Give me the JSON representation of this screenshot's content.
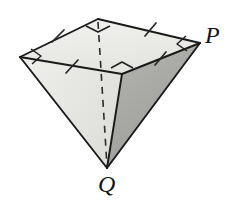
{
  "figure": {
    "name": "inverted-square-pyramid",
    "background_color": "#ffffff",
    "labels": [
      {
        "id": "P",
        "text": "P",
        "x": 205,
        "y": 23,
        "font_size": 24,
        "style": "italic-serif",
        "role": "base-vertex-label"
      },
      {
        "id": "Q",
        "text": "Q",
        "x": 98,
        "y": 172,
        "font_size": 24,
        "style": "italic-serif",
        "role": "apex-vertex-label"
      }
    ],
    "colors": {
      "top_face": "#ededea",
      "left_face": "#e7e7e4",
      "right_face": "#a9a9a6",
      "front_face": "#cfcfcc",
      "stroke": "#1a1a1a",
      "stroke_soft": "#3a3a3a",
      "tick": "#2a2a2a",
      "dashed": "#2b2b2b"
    },
    "vertices": {
      "base_left": {
        "x": 20,
        "y": 57
      },
      "base_back": {
        "x": 98,
        "y": 19
      },
      "base_right_P": {
        "x": 200,
        "y": 43
      },
      "base_front": {
        "x": 122,
        "y": 74
      },
      "apex_Q": {
        "x": 107,
        "y": 168
      }
    },
    "faces": [
      {
        "name": "top-base-square",
        "points": "20,57 98,19 200,43 122,74",
        "fill": "#ededea"
      },
      {
        "name": "left-lateral-face",
        "points": "20,57 122,74 107,168",
        "fill": "#e7e7e4"
      },
      {
        "name": "right-lateral-face",
        "points": "122,74 200,43 107,168",
        "fill": "#a9a9a6"
      }
    ],
    "edges": [
      {
        "name": "base-edge-left-back",
        "x1": 20,
        "y1": 57,
        "x2": 98,
        "y2": 19,
        "style": "solid"
      },
      {
        "name": "base-edge-back-right",
        "x1": 98,
        "y1": 19,
        "x2": 200,
        "y2": 43,
        "style": "solid"
      },
      {
        "name": "base-edge-right-front",
        "x1": 200,
        "y1": 43,
        "x2": 122,
        "y2": 74,
        "style": "solid"
      },
      {
        "name": "base-edge-front-left",
        "x1": 122,
        "y1": 74,
        "x2": 20,
        "y2": 57,
        "style": "solid"
      },
      {
        "name": "lateral-edge-left-apex",
        "x1": 20,
        "y1": 57,
        "x2": 107,
        "y2": 168,
        "style": "solid"
      },
      {
        "name": "lateral-edge-front-apex",
        "x1": 122,
        "y1": 74,
        "x2": 107,
        "y2": 168,
        "style": "solid"
      },
      {
        "name": "lateral-edge-right-apex",
        "x1": 200,
        "y1": 43,
        "x2": 107,
        "y2": 168,
        "style": "solid"
      },
      {
        "name": "lateral-edge-back-apex-hidden",
        "x1": 98,
        "y1": 19,
        "x2": 107,
        "y2": 168,
        "style": "dashed"
      }
    ],
    "tick_marks": [
      {
        "name": "tick-base-edge-left-back",
        "x1": 52,
        "y1": 30,
        "x2": 64,
        "y2": 42
      },
      {
        "name": "tick-base-edge-back-right",
        "x1": 144,
        "y1": 23,
        "x2": 155,
        "y2": 35
      },
      {
        "name": "tick-base-edge-right-front",
        "x1": 156,
        "y1": 53,
        "x2": 166,
        "y2": 64
      },
      {
        "name": "tick-base-edge-front-left",
        "x1": 66,
        "y1": 61,
        "x2": 78,
        "y2": 72
      }
    ],
    "right_angle_marks": [
      {
        "name": "right-angle-mark-back-vertex",
        "points": "86,27 98,19 110,27 98,32"
      },
      {
        "name": "right-angle-mark-left-vertex",
        "points": "31,50 20,57 33,64 42,55"
      },
      {
        "name": "right-angle-mark-front-vertex",
        "points": "110,67 122,74 134,67 122,61"
      },
      {
        "name": "right-angle-mark-P-vertex",
        "points": "187,37 200,43 188,50 178,44"
      }
    ]
  }
}
